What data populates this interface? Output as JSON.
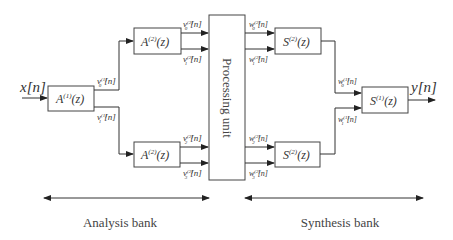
{
  "diagram": {
    "input_label": "x[n]",
    "output_label": "y[n]",
    "analysis_blocks": [
      {
        "id": "A1",
        "label": "A(1)(z)",
        "base": "A",
        "sup": "(1)",
        "arg": "(z)"
      },
      {
        "id": "A2_top",
        "label": "A(2)(z)",
        "base": "A",
        "sup": "(2)",
        "arg": "(z)"
      },
      {
        "id": "A2_bottom",
        "label": "A(2)(z)",
        "base": "A",
        "sup": "(2)",
        "arg": "(z)"
      }
    ],
    "processing_unit": {
      "label": "Processing unit"
    },
    "synthesis_blocks": [
      {
        "id": "S2_top",
        "label": "S(2)(z)",
        "base": "S",
        "sup": "(2)",
        "arg": "(z)"
      },
      {
        "id": "S2_bottom",
        "label": "S(2)(z)",
        "base": "S",
        "sup": "(2)",
        "arg": "(z)"
      },
      {
        "id": "S1",
        "label": "S(1)(z)",
        "base": "S",
        "sup": "(1)",
        "arg": "(z)"
      }
    ],
    "signals": {
      "v0_1": {
        "base": "v",
        "sub": "0",
        "sup": "(1)",
        "arg": "[n]"
      },
      "v1_1": {
        "base": "v",
        "sub": "1",
        "sup": "(1)",
        "arg": "[n]"
      },
      "v0_2": {
        "base": "v",
        "sub": "0",
        "sup": "(2)",
        "arg": "[n]"
      },
      "v1_2": {
        "base": "v",
        "sub": "1",
        "sup": "(2)",
        "arg": "[n]"
      },
      "v2_2": {
        "base": "v",
        "sub": "2",
        "sup": "(2)",
        "arg": "[n]"
      },
      "v3_2": {
        "base": "v",
        "sub": "3",
        "sup": "(2)",
        "arg": "[n]"
      },
      "w0_2": {
        "base": "w",
        "sub": "0",
        "sup": "(2)",
        "arg": "[n]"
      },
      "w1_2": {
        "base": "w",
        "sub": "1",
        "sup": "(2)",
        "arg": "[n]"
      },
      "w2_2": {
        "base": "w",
        "sub": "2",
        "sup": "(2)",
        "arg": "[n]"
      },
      "w3_2": {
        "base": "w",
        "sub": "3",
        "sup": "(2)",
        "arg": "[n]"
      },
      "w0_1": {
        "base": "w",
        "sub": "0",
        "sup": "(1)",
        "arg": "[n]"
      },
      "w1_1": {
        "base": "w",
        "sub": "1",
        "sup": "(1)",
        "arg": "[n]"
      }
    },
    "bank_labels": {
      "analysis": "Analysis bank",
      "synthesis": "Synthesis bank"
    }
  }
}
